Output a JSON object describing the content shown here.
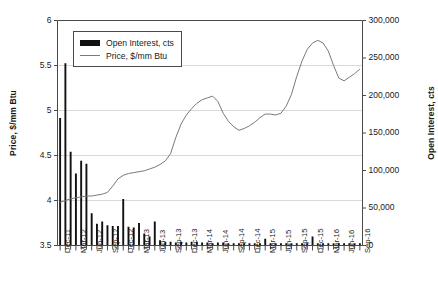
{
  "chart_data": {
    "type": "bar",
    "title": "",
    "subtitle": "",
    "xlabel": "",
    "ylabel": "Price, $/mm Btu",
    "y2label": "Open Interest, cts",
    "grid": true,
    "legend_position": "top-left",
    "ylim": [
      3.5,
      6
    ],
    "y2lim": [
      0,
      300000
    ],
    "y_ticks": [
      "3.5",
      "4",
      "4.5",
      "5",
      "5.5",
      "6"
    ],
    "y_tick_values": [
      3.5,
      4,
      4.5,
      5,
      5.5,
      6
    ],
    "y2_ticks": [
      "0",
      "50,000",
      "100,000",
      "150,000",
      "200,000",
      "250,000",
      "300,000"
    ],
    "y2_tick_values": [
      0,
      50000,
      100000,
      150000,
      200000,
      250000,
      300000
    ],
    "x_tick_labels": [
      "Dec-11",
      "Mar-12",
      "Jun-12",
      "Sep-12",
      "Dec-12",
      "Mar-13",
      "Jun-13",
      "Sep-13",
      "Dec-13",
      "Mar-14",
      "Jun-14",
      "Sep-14",
      "Dec-14",
      "Mar-15",
      "Jun-15",
      "Sep-15",
      "Dec-15",
      "Mar-16",
      "Jun-16",
      "Sep-16"
    ],
    "x_labeled_indices": [
      0,
      3,
      6,
      9,
      12,
      15,
      18,
      21,
      24,
      27,
      30,
      33,
      36,
      39,
      42,
      45,
      48,
      51,
      54,
      57
    ],
    "x_months": [
      "Dec-11",
      "Jan-12",
      "Feb-12",
      "Mar-12",
      "Apr-12",
      "May-12",
      "Jun-12",
      "Jul-12",
      "Aug-12",
      "Sep-12",
      "Oct-12",
      "Nov-12",
      "Dec-12",
      "Jan-13",
      "Feb-13",
      "Mar-13",
      "Apr-13",
      "May-13",
      "Jun-13",
      "Jul-13",
      "Aug-13",
      "Sep-13",
      "Oct-13",
      "Nov-13",
      "Dec-13",
      "Jan-14",
      "Feb-14",
      "Mar-14",
      "Apr-14",
      "May-14",
      "Jun-14",
      "Jul-14",
      "Aug-14",
      "Sep-14",
      "Oct-14",
      "Nov-14",
      "Dec-14",
      "Jan-15",
      "Feb-15",
      "Mar-15",
      "Apr-15",
      "May-15",
      "Jun-15",
      "Jul-15",
      "Aug-15",
      "Sep-15",
      "Oct-15",
      "Nov-15",
      "Dec-15",
      "Jan-16",
      "Feb-16",
      "Mar-16",
      "Apr-16",
      "May-16",
      "Jun-16",
      "Jul-16",
      "Aug-16",
      "Sep-16"
    ],
    "series": [
      {
        "name": "Open Interest, cts",
        "type": "bar",
        "color": "#111111",
        "axis": "right",
        "values": [
          170000,
          0,
          0,
          243000,
          0,
          0,
          0,
          0,
          0,
          0,
          0,
          0,
          0,
          0,
          0,
          0,
          0,
          0,
          0,
          0,
          0,
          0,
          0,
          0,
          0,
          0,
          0,
          0,
          0,
          0,
          0,
          0,
          0,
          0,
          0,
          0,
          0,
          0,
          0,
          0,
          0,
          0,
          0,
          0,
          0,
          0,
          0,
          0,
          0,
          0,
          0,
          0,
          0,
          0,
          0,
          0,
          0,
          0
        ]
      },
      {
        "name": "Open Interest, cts (monthly)",
        "type": "bar",
        "color": "#111111",
        "axis": "right",
        "values": [
          170000,
          243000,
          125000,
          96000,
          113000,
          109000,
          43000,
          29000,
          32000,
          27000,
          26000,
          26000,
          62000,
          25000,
          24000,
          30000,
          16000,
          12000,
          32000,
          7000,
          5000,
          5000,
          4000,
          5000,
          4000,
          5000,
          5000,
          4000,
          4000,
          3000,
          4000,
          4000,
          3000,
          3000,
          3000,
          3000,
          3000,
          3000,
          3000,
          9000,
          3000,
          3000,
          3000,
          3000,
          3000,
          3000,
          3000,
          3000,
          12000,
          3000,
          3000,
          3000,
          3000,
          3000,
          3000,
          3000,
          3000,
          3000
        ]
      },
      {
        "name": "Price, $/mm Btu",
        "type": "line",
        "color": "#7a7a7a",
        "axis": "left",
        "values": [
          3.98,
          4.0,
          4.02,
          4.03,
          4.04,
          4.05,
          4.05,
          4.06,
          4.07,
          4.09,
          4.16,
          4.24,
          4.28,
          4.3,
          4.31,
          4.32,
          4.33,
          4.35,
          4.37,
          4.4,
          4.44,
          4.52,
          4.7,
          4.85,
          4.95,
          5.02,
          5.08,
          5.12,
          5.14,
          5.16,
          5.1,
          4.97,
          4.88,
          4.82,
          4.78,
          4.8,
          4.83,
          4.87,
          4.92,
          4.96,
          4.96,
          4.95,
          4.97,
          5.05,
          5.18,
          5.38,
          5.55,
          5.68,
          5.75,
          5.78,
          5.75,
          5.66,
          5.5,
          5.36,
          5.33,
          5.37,
          5.41,
          5.46
        ]
      }
    ],
    "legend": [
      {
        "label": "Open Interest, cts",
        "marker": "bar-swatch",
        "color": "#111111"
      },
      {
        "label": "Price, $/mm Btu",
        "marker": "line-swatch",
        "color": "#7a7a7a"
      }
    ]
  }
}
